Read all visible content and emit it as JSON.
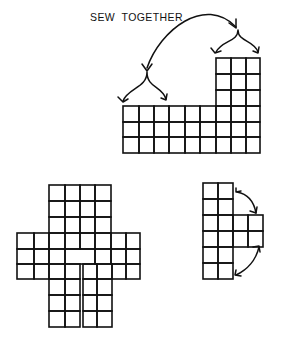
{
  "caption": "SEW  TOGETHER",
  "colors": {
    "ink": "#111111",
    "background": "#ffffff"
  },
  "pieces": [
    {
      "name": "top-piece",
      "description": "9x3 band with 3x3 tower on right",
      "cells": [
        [
          123,
          106,
          139,
          122
        ],
        [
          139,
          106,
          154,
          122
        ],
        [
          154,
          106,
          169,
          122
        ],
        [
          169,
          106,
          185,
          122
        ],
        [
          185,
          106,
          200,
          122
        ],
        [
          200,
          106,
          216,
          122
        ],
        [
          216,
          106,
          231,
          122
        ],
        [
          231,
          106,
          246,
          122
        ],
        [
          246,
          106,
          260,
          122
        ],
        [
          123,
          122,
          139,
          137
        ],
        [
          139,
          122,
          154,
          137
        ],
        [
          154,
          122,
          169,
          137
        ],
        [
          169,
          122,
          185,
          137
        ],
        [
          185,
          122,
          200,
          137
        ],
        [
          200,
          122,
          216,
          137
        ],
        [
          216,
          122,
          231,
          137
        ],
        [
          231,
          122,
          246,
          137
        ],
        [
          246,
          122,
          260,
          137
        ],
        [
          123,
          137,
          139,
          153
        ],
        [
          139,
          137,
          154,
          153
        ],
        [
          154,
          137,
          169,
          153
        ],
        [
          169,
          137,
          185,
          153
        ],
        [
          185,
          137,
          200,
          153
        ],
        [
          200,
          137,
          216,
          153
        ],
        [
          216,
          137,
          231,
          153
        ],
        [
          231,
          137,
          246,
          153
        ],
        [
          246,
          137,
          260,
          153
        ],
        [
          216,
          58,
          231,
          74
        ],
        [
          231,
          58,
          246,
          74
        ],
        [
          246,
          58,
          260,
          74
        ],
        [
          216,
          74,
          231,
          90
        ],
        [
          231,
          74,
          246,
          90
        ],
        [
          246,
          74,
          260,
          90
        ],
        [
          216,
          90,
          231,
          106
        ],
        [
          231,
          90,
          246,
          106
        ],
        [
          246,
          90,
          260,
          106
        ]
      ]
    },
    {
      "name": "cross-piece",
      "description": "cross-shaped piece with slit between two legs",
      "cells": [
        [
          49,
          185,
          65,
          201
        ],
        [
          65,
          185,
          80,
          201
        ],
        [
          80,
          185,
          95,
          201
        ],
        [
          95,
          185,
          111,
          201
        ],
        [
          49,
          201,
          65,
          217
        ],
        [
          65,
          201,
          80,
          217
        ],
        [
          80,
          201,
          95,
          217
        ],
        [
          95,
          201,
          111,
          217
        ],
        [
          49,
          217,
          65,
          233
        ],
        [
          65,
          217,
          80,
          233
        ],
        [
          80,
          217,
          95,
          233
        ],
        [
          95,
          217,
          111,
          233
        ],
        [
          17,
          233,
          34,
          249
        ],
        [
          34,
          233,
          49,
          249
        ],
        [
          49,
          233,
          65,
          249
        ],
        [
          65,
          233,
          80,
          249
        ],
        [
          80,
          233,
          95,
          249
        ],
        [
          95,
          233,
          111,
          249
        ],
        [
          111,
          233,
          126,
          249
        ],
        [
          126,
          233,
          140,
          249
        ],
        [
          17,
          249,
          34,
          264
        ],
        [
          34,
          249,
          49,
          264
        ],
        [
          49,
          249,
          65,
          264
        ],
        [
          65,
          249,
          95,
          264
        ],
        [
          95,
          249,
          111,
          264
        ],
        [
          111,
          249,
          126,
          264
        ],
        [
          126,
          249,
          140,
          264
        ],
        [
          17,
          264,
          34,
          279
        ],
        [
          34,
          264,
          49,
          279
        ],
        [
          49,
          264,
          65,
          279
        ],
        [
          65,
          264,
          80,
          279
        ],
        [
          83,
          264,
          97,
          279
        ],
        [
          97,
          264,
          112,
          279
        ],
        [
          112,
          264,
          126,
          279
        ],
        [
          126,
          264,
          140,
          279
        ],
        [
          49,
          279,
          65,
          295
        ],
        [
          65,
          279,
          80,
          295
        ],
        [
          83,
          279,
          97,
          295
        ],
        [
          97,
          279,
          112,
          295
        ],
        [
          49,
          295,
          65,
          311
        ],
        [
          65,
          295,
          80,
          311
        ],
        [
          83,
          295,
          97,
          311
        ],
        [
          97,
          295,
          112,
          311
        ],
        [
          49,
          311,
          65,
          327
        ],
        [
          65,
          311,
          80,
          327
        ],
        [
          83,
          311,
          97,
          327
        ],
        [
          97,
          311,
          112,
          327
        ]
      ]
    },
    {
      "name": "t-piece",
      "description": "2x6 column with 2x2 tab on right",
      "cells": [
        [
          203,
          183,
          218,
          199
        ],
        [
          218,
          183,
          233,
          199
        ],
        [
          203,
          199,
          218,
          215
        ],
        [
          218,
          199,
          233,
          215
        ],
        [
          203,
          215,
          218,
          231
        ],
        [
          218,
          215,
          233,
          231
        ],
        [
          233,
          215,
          248,
          231
        ],
        [
          248,
          215,
          263,
          231
        ],
        [
          203,
          231,
          218,
          247
        ],
        [
          218,
          231,
          233,
          247
        ],
        [
          233,
          231,
          248,
          247
        ],
        [
          248,
          231,
          263,
          247
        ],
        [
          203,
          247,
          218,
          263
        ],
        [
          218,
          247,
          233,
          263
        ],
        [
          203,
          263,
          218,
          279
        ],
        [
          218,
          263,
          233,
          279
        ]
      ]
    }
  ],
  "arrows": [
    {
      "name": "sew-together-arc-arrow",
      "path": "M147 68 C 160 30, 205 -5, 236 27",
      "heads": [
        [
          147,
          70,
          -1
        ],
        [
          236,
          27,
          1
        ]
      ]
    },
    {
      "name": "right-fork-arrow",
      "path": "M238 30 C 238 42, 222 40, 216 52 M238 30 C 238 42, 254 40, 258 52",
      "heads": []
    },
    {
      "name": "left-fork-arrow",
      "path": "M147 72 C 147 88, 128 88, 123 101 M147 72 C 147 88, 162 86, 166 99",
      "heads": []
    },
    {
      "name": "upper-curved-double-arrow",
      "path": "M237 192 C 248 194, 254 202, 256 213",
      "heads": []
    },
    {
      "name": "lower-curved-double-arrow",
      "path": "M259 247 C 256 260, 247 270, 236 275",
      "heads": []
    }
  ],
  "arrowheads": [
    "M142 64 L147 71 L152 64",
    "M229 23 L236 28 L236 19",
    "M211 48 L215 53 L221 51",
    "M253 51 L258 53 L259 47",
    "M118 97 L123 102 L128 99",
    "M161 98 L166 100 L167 94",
    "M236 188 L236 192 L241 191",
    "M250 211 L256 213 L257 207",
    "M253 247 L259 246 L260 252",
    "M236 270 L235 275 L241 276"
  ]
}
